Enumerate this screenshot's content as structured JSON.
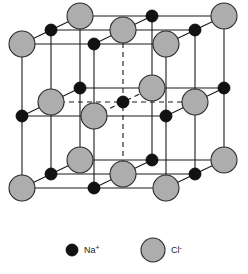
{
  "figure": {
    "canvas": {
      "width": 248,
      "height": 274,
      "background": "#ffffff"
    }
  },
  "projection": {
    "origin_x": 22,
    "origin_y": 188,
    "cell_size": 144,
    "depth_dx": 58,
    "depth_dy": -28,
    "divisions": 2
  },
  "style": {
    "edge_color": "#1a1a1a",
    "edge_width": 1.1,
    "hidden_color": "#1a1a1a",
    "hidden_width": 1.1,
    "hidden_dash": "5,4",
    "na_fill": "#121212",
    "na_stroke": "#000000",
    "na_radius": 6,
    "cl_fill": "#adadad",
    "cl_stroke": "#2b2b2b",
    "cl_radius": 13,
    "cl_stroke_width": 1.1
  },
  "lattice": {
    "description": "Face-centred cubic rock-salt arrangement: Na+ and Cl- alternate on every lattice point of a 3x3x3 grid of the unit cell.",
    "grid_points_per_edge": 3,
    "ion_rule": "(i+j+k) even = Cl-, odd = Na+",
    "corner_species": "Cl-",
    "na_count": 13,
    "cl_count": 14,
    "ions": [
      {
        "i": 0,
        "j": 0,
        "k": 0,
        "species": "Cl-"
      },
      {
        "i": 1,
        "j": 0,
        "k": 0,
        "species": "Na+"
      },
      {
        "i": 2,
        "j": 0,
        "k": 0,
        "species": "Cl-"
      },
      {
        "i": 0,
        "j": 1,
        "k": 0,
        "species": "Na+"
      },
      {
        "i": 1,
        "j": 1,
        "k": 0,
        "species": "Cl-"
      },
      {
        "i": 2,
        "j": 1,
        "k": 0,
        "species": "Na+"
      },
      {
        "i": 0,
        "j": 2,
        "k": 0,
        "species": "Cl-"
      },
      {
        "i": 1,
        "j": 2,
        "k": 0,
        "species": "Na+"
      },
      {
        "i": 2,
        "j": 2,
        "k": 0,
        "species": "Cl-"
      },
      {
        "i": 0,
        "j": 0,
        "k": 1,
        "species": "Na+"
      },
      {
        "i": 1,
        "j": 0,
        "k": 1,
        "species": "Cl-"
      },
      {
        "i": 2,
        "j": 0,
        "k": 1,
        "species": "Na+"
      },
      {
        "i": 0,
        "j": 1,
        "k": 1,
        "species": "Cl-"
      },
      {
        "i": 1,
        "j": 1,
        "k": 1,
        "species": "Na+"
      },
      {
        "i": 2,
        "j": 1,
        "k": 1,
        "species": "Cl-"
      },
      {
        "i": 0,
        "j": 2,
        "k": 1,
        "species": "Na+"
      },
      {
        "i": 1,
        "j": 2,
        "k": 1,
        "species": "Cl-"
      },
      {
        "i": 2,
        "j": 2,
        "k": 1,
        "species": "Na+"
      },
      {
        "i": 0,
        "j": 0,
        "k": 2,
        "species": "Cl-"
      },
      {
        "i": 1,
        "j": 0,
        "k": 2,
        "species": "Na+"
      },
      {
        "i": 2,
        "j": 0,
        "k": 2,
        "species": "Cl-"
      },
      {
        "i": 0,
        "j": 1,
        "k": 2,
        "species": "Na+"
      },
      {
        "i": 1,
        "j": 1,
        "k": 2,
        "species": "Cl-"
      },
      {
        "i": 2,
        "j": 1,
        "k": 2,
        "species": "Na+"
      },
      {
        "i": 0,
        "j": 2,
        "k": 2,
        "species": "Cl-"
      },
      {
        "i": 1,
        "j": 2,
        "k": 2,
        "species": "Na+"
      },
      {
        "i": 2,
        "j": 2,
        "k": 2,
        "species": "Cl-"
      }
    ]
  },
  "legend": {
    "items": [
      {
        "id": "na",
        "symbol": "Na",
        "charge": "+",
        "label": "Na+",
        "marker": "na-ion-marker",
        "marker_fill": "#121212",
        "marker_radius": 6,
        "x": 72,
        "y": 250,
        "text_x": 84,
        "text_y": 253
      },
      {
        "id": "cl",
        "symbol": "Cl",
        "charge": "-",
        "label": "Cl-",
        "marker": "cl-ion-marker",
        "marker_fill": "#adadad",
        "marker_radius": 12,
        "x": 153,
        "y": 250,
        "text_x": 171,
        "text_y": 253
      }
    ]
  }
}
